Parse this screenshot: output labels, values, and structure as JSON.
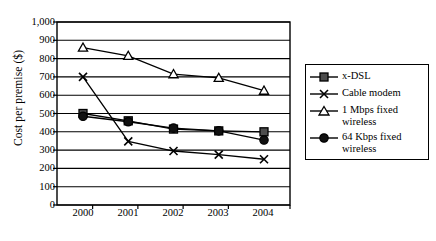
{
  "chart_data": {
    "type": "line",
    "title": "",
    "xlabel": "",
    "ylabel": "Cost per premise ($)",
    "categories": [
      "2000",
      "2001",
      "2002",
      "2003",
      "2004"
    ],
    "ylim": [
      0,
      1000
    ],
    "ytick_step": 100,
    "yticks": [
      "0",
      "100",
      "200",
      "300",
      "400",
      "500",
      "600",
      "700",
      "800",
      "900",
      "1,000"
    ],
    "grid": "horizontal",
    "legend_position": "right",
    "series": [
      {
        "name": "x-DSL",
        "marker": "square",
        "values": [
          500,
          460,
          415,
          405,
          400
        ]
      },
      {
        "name": "Cable modem",
        "marker": "x-cross",
        "values": [
          700,
          348,
          295,
          275,
          250
        ]
      },
      {
        "name": "1 Mbps fixed wireless",
        "marker": "triangle",
        "values": [
          860,
          815,
          715,
          695,
          625
        ]
      },
      {
        "name": "64 Kbps fixed wireless",
        "marker": "circle",
        "values": [
          485,
          455,
          420,
          405,
          355
        ]
      }
    ]
  },
  "legend": {
    "items": [
      {
        "label": "x-DSL",
        "marker": "square-marker-icon"
      },
      {
        "label": "Cable modem",
        "marker": "x-cross-marker-icon"
      },
      {
        "label": "1 Mbps fixed wireless",
        "marker": "triangle-marker-icon"
      },
      {
        "label": "64 Kbps fixed wireless",
        "marker": "circle-marker-icon"
      }
    ]
  }
}
